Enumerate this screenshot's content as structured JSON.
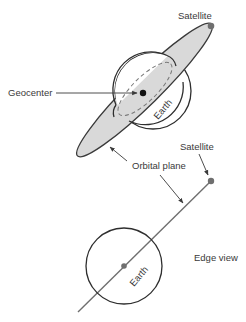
{
  "diagram": {
    "colors": {
      "line": "#3a3a3a",
      "orbit_fill": "#d9d9d9",
      "satellite": "#6f6f6f",
      "text": "#3a3a3a"
    },
    "top_view": {
      "satellite_label": "Satellite",
      "geocenter_label": "Geocenter",
      "earth_label": "Earth"
    },
    "orbital_plane_label": "Orbital plane",
    "edge_view": {
      "satellite_label": "Satellite",
      "earth_label": "Earth",
      "caption": "Edge view"
    }
  }
}
